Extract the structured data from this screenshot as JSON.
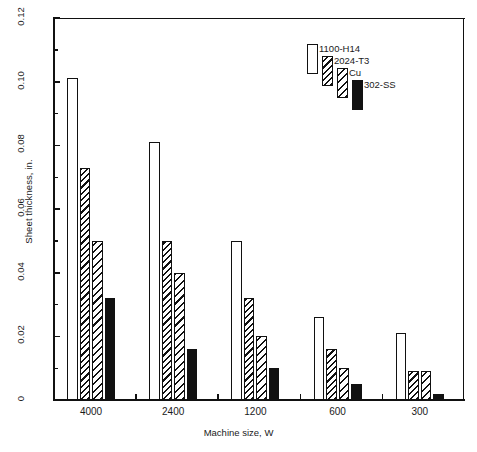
{
  "chart_data": {
    "type": "bar",
    "title": "",
    "xlabel": "Machine size, W",
    "ylabel": "Sheet thickness, in.",
    "categories": [
      "4000",
      "2400",
      "1200",
      "600",
      "300"
    ],
    "series": [
      {
        "name": "1100-H14",
        "pattern": "none",
        "values": [
          0.101,
          0.081,
          0.05,
          0.026,
          0.021
        ]
      },
      {
        "name": "2024-T3",
        "pattern": "diag",
        "values": [
          0.073,
          0.05,
          0.032,
          0.016,
          0.009
        ]
      },
      {
        "name": "Cu",
        "pattern": "diag2",
        "values": [
          0.05,
          0.04,
          0.02,
          0.01,
          0.009
        ]
      },
      {
        "name": "302-SS",
        "pattern": "cross",
        "values": [
          0.032,
          0.016,
          0.01,
          0.005,
          0.002
        ]
      }
    ],
    "ylim": [
      0,
      0.12
    ],
    "ytick_labels": [
      "0",
      "0.02",
      "0.04",
      "0.06",
      "0.08",
      "0.10",
      "0.12"
    ],
    "ytick_values": [
      0,
      0.02,
      0.04,
      0.06,
      0.08,
      0.1,
      0.12
    ],
    "yminor_values": [
      0.01,
      0.03,
      0.05,
      0.07,
      0.09,
      0.11
    ],
    "grid": false,
    "legend_position": "upper-right-inside",
    "frame": "box",
    "bar_color": "#ffffff",
    "line_color": "#111111"
  },
  "axes": {
    "y_title": "Sheet thickness, in.",
    "x_title": "Machine size, W"
  },
  "legend": {
    "entries": [
      {
        "label": "1100-H14"
      },
      {
        "label": "2024-T3"
      },
      {
        "label": "Cu"
      },
      {
        "label": "302-SS"
      }
    ]
  }
}
